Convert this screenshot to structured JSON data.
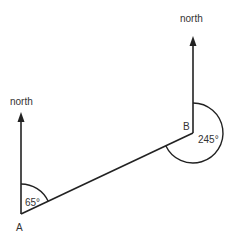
{
  "diagram": {
    "type": "bearing-diagram",
    "points": [
      {
        "id": "A",
        "label": "A"
      },
      {
        "id": "B",
        "label": "B"
      }
    ],
    "north_labels": {
      "left": "north",
      "right": "north"
    },
    "angles": {
      "at_A": "65°",
      "at_B": "245°"
    },
    "colors": {
      "line": "#222222",
      "text": "#333333",
      "background": "#ffffff"
    }
  }
}
